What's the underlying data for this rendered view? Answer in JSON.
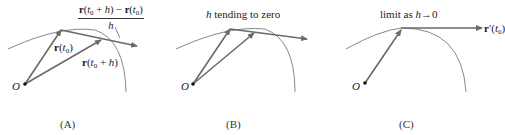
{
  "panels": [
    {
      "caption": "(A)",
      "origin_label": "O",
      "fraction": {
        "numerator": "r(t0 + h) − r(t0)",
        "denominator": "h"
      },
      "vector_labels": [
        "r(t0)",
        "r(t0 + h)"
      ]
    },
    {
      "caption": "(B)",
      "origin_label": "O",
      "title": "h tending to zero"
    },
    {
      "caption": "(C)",
      "origin_label": "O",
      "title": "limit as h→0",
      "tangent_label": "r′(t0)"
    }
  ],
  "text": {
    "a_cap": "(A)",
    "b_cap": "(B)",
    "c_cap": "(C)",
    "origin": "O",
    "b_title_h": "h",
    "b_title_rest": " tending to zero",
    "c_title_pre": "limit as ",
    "c_title_h": "h",
    "c_title_post": "→0",
    "frac_den": "h"
  },
  "colors": {
    "curve": "#7a7a7a",
    "vector": "#6a6a6a",
    "text": "#222222"
  }
}
